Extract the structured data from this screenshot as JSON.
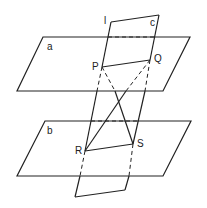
{
  "diagram": {
    "type": "geometry-planes",
    "planes": {
      "a": {
        "label": "a",
        "vertices": [
          [
            43,
            37
          ],
          [
            190,
            37
          ],
          [
            163,
            91
          ],
          [
            17,
            91
          ]
        ]
      },
      "b": {
        "label": "b",
        "vertices": [
          [
            45,
            121
          ],
          [
            191,
            121
          ],
          [
            163,
            176
          ],
          [
            17,
            176
          ]
        ]
      },
      "c": {
        "label": "c",
        "vertices": [
          [
            111,
            22
          ],
          [
            159,
            15
          ],
          [
            125,
            190
          ],
          [
            75,
            197
          ]
        ]
      }
    },
    "line_label": "l",
    "points": {
      "P": {
        "label": "P",
        "pos": [
          102,
          67
        ]
      },
      "Q": {
        "label": "Q",
        "pos": [
          150,
          60
        ]
      },
      "R": {
        "label": "R",
        "pos": [
          85,
          151
        ]
      },
      "S": {
        "label": "S",
        "pos": [
          133,
          144
        ]
      }
    },
    "segments": [
      "PQ",
      "RS",
      "PS",
      "QR",
      "PR",
      "QS"
    ]
  }
}
